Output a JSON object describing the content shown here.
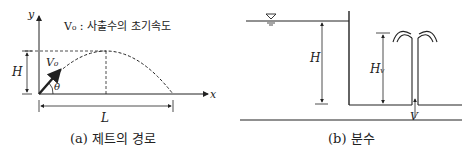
{
  "figure_a": {
    "caption": "(a) 제트의 경로",
    "legend": "V₀ : 사출수의 초기속도",
    "labels": {
      "y_axis": "y",
      "x_axis": "x",
      "height": "H",
      "length": "L",
      "velocity": "V₀",
      "angle": "θ"
    }
  },
  "figure_b": {
    "caption": "(b) 분수",
    "labels": {
      "head": "H",
      "velocity_head": "Hᵥ",
      "velocity": "V"
    }
  },
  "colors": {
    "line": "#222222",
    "background": "#ffffff"
  }
}
